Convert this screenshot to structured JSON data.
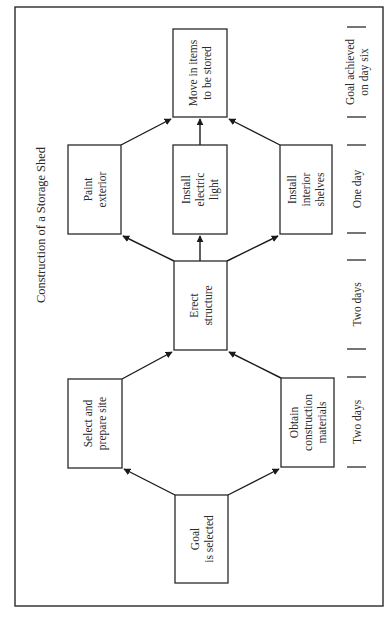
{
  "title": "Construction of a Storage Shed",
  "orientation": "rotated -90deg (text reads bottom-to-top)",
  "nodes": [
    {
      "id": "goal",
      "lines": [
        "Goal",
        "is selected"
      ],
      "x": 175,
      "y": 495,
      "w": 53,
      "h": 88
    },
    {
      "id": "site",
      "lines": [
        "Select and",
        "prepare site"
      ],
      "x": 68,
      "y": 379,
      "w": 54,
      "h": 89
    },
    {
      "id": "materials",
      "lines": [
        "Obtain",
        "construction",
        "materials"
      ],
      "x": 281,
      "y": 378,
      "w": 53,
      "h": 89
    },
    {
      "id": "erect",
      "lines": [
        "Erect",
        "structure"
      ],
      "x": 174,
      "y": 261,
      "w": 53,
      "h": 89
    },
    {
      "id": "paint",
      "lines": [
        "Paint",
        "exterior"
      ],
      "x": 68,
      "y": 145,
      "w": 53,
      "h": 89
    },
    {
      "id": "light",
      "lines": [
        "Install",
        "electric",
        "light"
      ],
      "x": 173,
      "y": 145,
      "w": 54,
      "h": 89
    },
    {
      "id": "shelves",
      "lines": [
        "Install",
        "interior",
        "shelves"
      ],
      "x": 280,
      "y": 145,
      "w": 52,
      "h": 89
    },
    {
      "id": "move",
      "lines": [
        "Move in items",
        "to be stored"
      ],
      "x": 173,
      "y": 29,
      "w": 54,
      "h": 88
    }
  ],
  "edges": [
    {
      "from": "goal",
      "to": "site",
      "x1": 175,
      "y1": 495,
      "x2": 124,
      "y2": 469
    },
    {
      "from": "goal",
      "to": "materials",
      "x1": 228,
      "y1": 495,
      "x2": 279,
      "y2": 469
    },
    {
      "from": "site",
      "to": "erect",
      "x1": 122,
      "y1": 379,
      "x2": 172,
      "y2": 352
    },
    {
      "from": "materials",
      "to": "erect",
      "x1": 281,
      "y1": 378,
      "x2": 229,
      "y2": 352
    },
    {
      "from": "erect",
      "to": "paint",
      "x1": 174,
      "y1": 261,
      "x2": 123,
      "y2": 236
    },
    {
      "from": "erect",
      "to": "light",
      "x1": 200,
      "y1": 261,
      "x2": 200,
      "y2": 236
    },
    {
      "from": "erect",
      "to": "shelves",
      "x1": 227,
      "y1": 261,
      "x2": 278,
      "y2": 236
    },
    {
      "from": "paint",
      "to": "move",
      "x1": 121,
      "y1": 145,
      "x2": 171,
      "y2": 119
    },
    {
      "from": "light",
      "to": "move",
      "x1": 200,
      "y1": 145,
      "x2": 200,
      "y2": 119
    },
    {
      "from": "shelves",
      "to": "move",
      "x1": 280,
      "y1": 145,
      "x2": 229,
      "y2": 119
    }
  ],
  "timeline": {
    "segments": [
      {
        "lines": [
          "Two days"
        ],
        "y_start": 377,
        "y_end": 467
      },
      {
        "lines": [
          "Two days"
        ],
        "y_start": 260,
        "y_end": 349
      },
      {
        "lines": [
          "One day"
        ],
        "y_start": 145,
        "y_end": 233
      },
      {
        "lines": [
          "Goal achieved",
          "on day six"
        ],
        "y_start": 27,
        "y_end": 117
      }
    ],
    "ticks": [
      27,
      117,
      145,
      233,
      260,
      349,
      377,
      467
    ]
  },
  "frame": {
    "x": 15,
    "y": 7,
    "w": 368,
    "h": 599
  }
}
